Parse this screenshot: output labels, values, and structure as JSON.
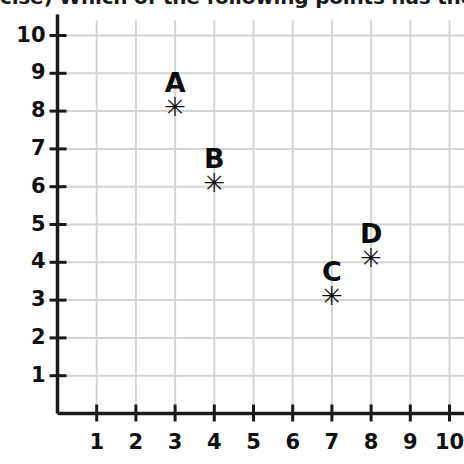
{
  "question": {
    "text": "cise) Which of the following points has the"
  },
  "chart_data": {
    "type": "scatter",
    "title": "",
    "xlabel": "",
    "ylabel": "",
    "xlim": [
      0,
      10.4
    ],
    "ylim": [
      0,
      10.4
    ],
    "xticks": [
      1,
      2,
      3,
      4,
      5,
      6,
      7,
      8,
      9,
      10
    ],
    "yticks": [
      1,
      2,
      3,
      4,
      5,
      6,
      7,
      8,
      9,
      10
    ],
    "xtick_labels": [
      "1",
      "2",
      "3",
      "4",
      "5",
      "6",
      "7",
      "8",
      "9",
      "10"
    ],
    "ytick_labels": [
      "1",
      "2",
      "3",
      "4",
      "5",
      "6",
      "7",
      "8",
      "9",
      "10"
    ],
    "grid": true,
    "grid_color": "#d4d4d4",
    "axis_color": "#1a1a1a",
    "marker": "asterisk",
    "marker_glyph": "✳",
    "legend": "none",
    "points": [
      {
        "label": "A",
        "x": 3,
        "y": 8
      },
      {
        "label": "B",
        "x": 4,
        "y": 6
      },
      {
        "label": "C",
        "x": 7,
        "y": 3
      },
      {
        "label": "D",
        "x": 8,
        "y": 4
      }
    ]
  }
}
